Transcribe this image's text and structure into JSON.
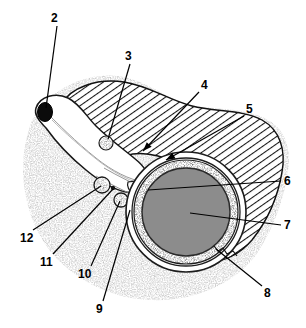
{
  "figure": {
    "type": "anatomical-cross-section",
    "width": 306,
    "height": 328,
    "background_color": "#ffffff",
    "ink_color": "#000000"
  },
  "regions": [
    {
      "id": "stippled-outer-zone",
      "name": "stippled-outer-zone",
      "fill_style": "stipple",
      "fill_color": "#9a9a9a",
      "description": "granular speckled band along outer/lower margin"
    },
    {
      "id": "hatched-zone",
      "name": "hatched-zone",
      "fill_style": "diagonal-hatch",
      "fill_color": "#ffffff",
      "line_color": "#1a1a1a",
      "description": "diagonal line hatching filling main body of section"
    },
    {
      "id": "lumen-duct",
      "name": "lumen-duct",
      "fill_style": "solid",
      "fill_color": "#ffffff",
      "description": "elongated white duct running from upper left to centre"
    },
    {
      "id": "central-vessel",
      "name": "central-vessel",
      "fill_style": "solid",
      "fill_color": "#8c8c8c",
      "ring_color": "#3b3b3b",
      "outer_ring_color": "#ffffff",
      "description": "large circular vessel with dark stippled wall and grey lumen"
    }
  ],
  "features": [
    {
      "id": "dark-oval",
      "name": "dark-oval-structure",
      "fill_color": "#0d0d0d",
      "cx": 45,
      "cy": 112,
      "rx": 8,
      "ry": 10
    },
    {
      "id": "small-circle-3",
      "name": "small-stippled-circle-3",
      "fill_color": "#b4b4b4",
      "cx": 106,
      "cy": 143,
      "r": 7
    },
    {
      "id": "small-circle-11",
      "name": "small-stippled-circle-11",
      "fill_color": "#b4b4b4",
      "cx": 102,
      "cy": 185,
      "r": 8
    },
    {
      "id": "small-circle-10",
      "name": "small-stippled-circle-10",
      "fill_color": "#b4b4b4",
      "cx": 121,
      "cy": 200,
      "r": 7
    },
    {
      "id": "tiny-dot-9",
      "name": "tiny-dot-9",
      "fill_color": "#1a1a1a",
      "cx": 113,
      "cy": 188,
      "r": 2
    }
  ],
  "callouts": [
    {
      "number": "2",
      "name": "callout-2",
      "label_x": 51,
      "label_y": 12,
      "line_from": [
        57,
        26
      ],
      "line_to": [
        46,
        108
      ],
      "arrow": false
    },
    {
      "number": "3",
      "name": "callout-3",
      "label_x": 125,
      "label_y": 50,
      "line_from": [
        130,
        64
      ],
      "line_to": [
        108,
        139
      ],
      "arrow": false
    },
    {
      "number": "4",
      "name": "callout-4",
      "label_x": 201,
      "label_y": 79,
      "line_from": [
        199,
        92
      ],
      "line_to": [
        143,
        151
      ],
      "arrow": true
    },
    {
      "number": "5",
      "name": "callout-5",
      "label_x": 246,
      "label_y": 103,
      "line_from": [
        244,
        116
      ],
      "line_to": [
        166,
        160
      ],
      "arrow": true
    },
    {
      "number": "6",
      "name": "callout-6",
      "label_x": 284,
      "label_y": 175,
      "line_from": [
        281,
        181
      ],
      "line_to": [
        148,
        190
      ],
      "arrow": false
    },
    {
      "number": "7",
      "name": "callout-7",
      "label_x": 284,
      "label_y": 219,
      "line_from": [
        281,
        225
      ],
      "line_to": [
        190,
        213
      ],
      "arrow": false
    },
    {
      "number": "8",
      "name": "callout-8",
      "label_x": 264,
      "label_y": 287,
      "line_from": [
        262,
        286
      ],
      "line_to": [
        216,
        249
      ],
      "arrow": false
    },
    {
      "number": "9",
      "name": "callout-9",
      "label_x": 96,
      "label_y": 303,
      "line_from": [
        103,
        301
      ],
      "line_to": [
        130,
        210
      ],
      "arrow": false
    },
    {
      "number": "10",
      "name": "callout-10",
      "label_x": 78,
      "label_y": 268,
      "line_from": [
        91,
        266
      ],
      "line_to": [
        120,
        201
      ],
      "arrow": false
    },
    {
      "number": "11",
      "name": "callout-11",
      "label_x": 40,
      "label_y": 256,
      "line_from": [
        53,
        254
      ],
      "line_to": [
        113,
        189
      ],
      "arrow": false
    },
    {
      "number": "12",
      "name": "callout-12",
      "label_x": 20,
      "label_y": 232,
      "line_from": [
        33,
        230
      ],
      "line_to": [
        101,
        186
      ],
      "arrow": false
    }
  ]
}
